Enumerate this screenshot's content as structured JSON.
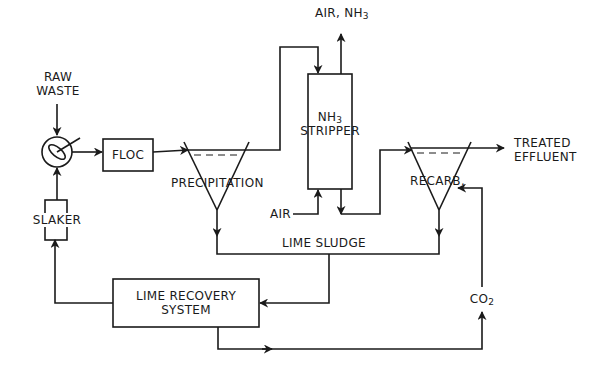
{
  "diagram": {
    "nodes": {
      "raw_waste": {
        "line1": "RAW",
        "line2": "WASTE"
      },
      "floc": {
        "label": "FLOC"
      },
      "precipitation": {
        "label": "PRECIPITATION"
      },
      "stripper": {
        "line1_base": "NH",
        "line1_sub": "3",
        "line2": "STRIPPER"
      },
      "air_nh3_out": {
        "prefix": "AIR, NH",
        "sub": "3"
      },
      "air_in": {
        "label": "AIR"
      },
      "recarb": {
        "label": "RECARB."
      },
      "treated_effluent": {
        "line1": "TREATED",
        "line2": "EFFLUENT"
      },
      "slaker": {
        "label": "SLAKER"
      },
      "lime_sludge": {
        "label": "LIME SLUDGE"
      },
      "lime_recovery": {
        "line1": "LIME RECOVERY",
        "line2": "SYSTEM"
      },
      "co2": {
        "base": "CO",
        "sub": "2"
      }
    },
    "colors": {
      "line": "#1a1a1a",
      "background": "#ffffff"
    }
  }
}
